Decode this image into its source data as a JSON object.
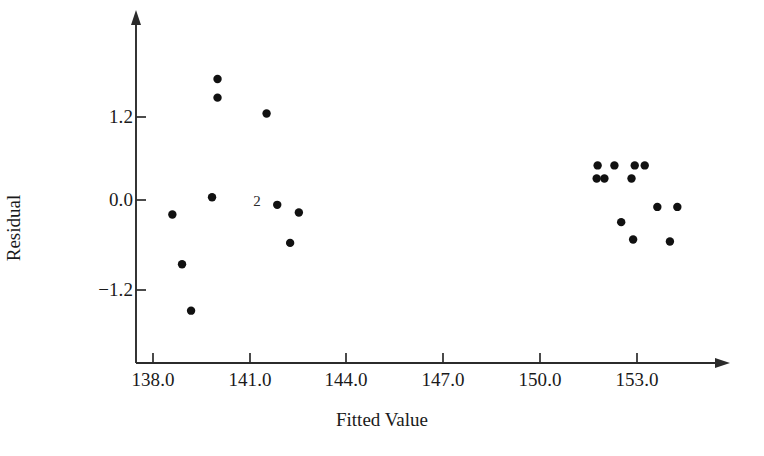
{
  "chart_data": {
    "type": "scatter",
    "title": "",
    "xlabel": "Fitted Value",
    "ylabel": "Residual",
    "xlim": [
      137.2,
      155.0
    ],
    "ylim": [
      -2.2,
      2.3
    ],
    "grid": false,
    "legend": null,
    "xticks": [
      "138.0",
      "141.0",
      "144.0",
      "147.0",
      "150.0",
      "153.0"
    ],
    "xtick_values": [
      138.0,
      141.0,
      144.0,
      147.0,
      150.0,
      153.0
    ],
    "yticks": [
      "1.2",
      "0.0",
      "−1.2"
    ],
    "ytick_values": [
      1.2,
      0.0,
      -1.2
    ],
    "marker": "filled-circle",
    "marker_color": "#111111",
    "axis_color": "#2b2b2b",
    "series": [
      {
        "name": "residuals",
        "points": [
          {
            "x": 140.0,
            "y": 1.75
          },
          {
            "x": 140.0,
            "y": 1.48
          },
          {
            "x": 141.52,
            "y": 1.25
          },
          {
            "x": 138.6,
            "y": -0.21
          },
          {
            "x": 138.9,
            "y": -0.93
          },
          {
            "x": 139.18,
            "y": -1.6
          },
          {
            "x": 139.83,
            "y": 0.04
          },
          {
            "x": 141.85,
            "y": -0.07
          },
          {
            "x": 142.52,
            "y": -0.18
          },
          {
            "x": 142.25,
            "y": -0.62
          },
          {
            "x": 151.78,
            "y": 0.5
          },
          {
            "x": 152.3,
            "y": 0.5
          },
          {
            "x": 152.93,
            "y": 0.5
          },
          {
            "x": 153.24,
            "y": 0.5
          },
          {
            "x": 151.75,
            "y": 0.31
          },
          {
            "x": 151.99,
            "y": 0.31
          },
          {
            "x": 152.83,
            "y": 0.31
          },
          {
            "x": 153.63,
            "y": -0.1
          },
          {
            "x": 154.25,
            "y": -0.1
          },
          {
            "x": 152.51,
            "y": -0.32
          },
          {
            "x": 152.88,
            "y": -0.57
          },
          {
            "x": 154.02,
            "y": -0.6
          }
        ]
      }
    ],
    "annotations": [
      {
        "text": "2",
        "x": 141.22,
        "y": -0.01,
        "meaning": "two-coincident-points"
      }
    ]
  }
}
